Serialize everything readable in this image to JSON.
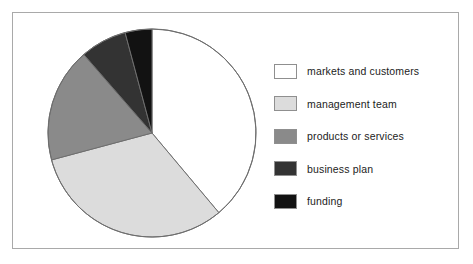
{
  "figure": {
    "background_color": "#ffffff",
    "frame_color": "#a9a9a9"
  },
  "chart_data": {
    "type": "pie",
    "title": "",
    "xlabel": "",
    "ylabel": "",
    "start_angle_deg": 0,
    "direction": "clockwise",
    "legend_position": "right",
    "grid": false,
    "categories": [
      "markets and customers",
      "management team",
      "products or services",
      "business plan",
      "funding"
    ],
    "values": [
      39,
      32,
      18,
      7,
      4
    ],
    "units": "percent",
    "angles_deg": [
      140,
      115,
      64,
      26,
      15
    ],
    "colors": [
      "#ffffff",
      "#dcdcdc",
      "#8a8a8a",
      "#333333",
      "#121212"
    ],
    "slice_edge_color": "#6e6e6e",
    "slices": [
      {
        "label": "markets and customers",
        "value": 39,
        "color": "#ffffff",
        "start_deg": 0,
        "end_deg": 140
      },
      {
        "label": "management team",
        "value": 32,
        "color": "#dcdcdc",
        "start_deg": 140,
        "end_deg": 255
      },
      {
        "label": "products or services",
        "value": 18,
        "color": "#8a8a8a",
        "start_deg": 255,
        "end_deg": 319
      },
      {
        "label": "business plan",
        "value": 7,
        "color": "#333333",
        "start_deg": 319,
        "end_deg": 345
      },
      {
        "label": "funding",
        "value": 4,
        "color": "#121212",
        "start_deg": 345,
        "end_deg": 360
      }
    ]
  },
  "legend": {
    "items": [
      {
        "label": "markets and customers",
        "color": "#ffffff"
      },
      {
        "label": "management team",
        "color": "#dcdcdc"
      },
      {
        "label": "products or services",
        "color": "#8a8a8a"
      },
      {
        "label": "business plan",
        "color": "#333333"
      },
      {
        "label": "funding",
        "color": "#121212"
      }
    ]
  }
}
